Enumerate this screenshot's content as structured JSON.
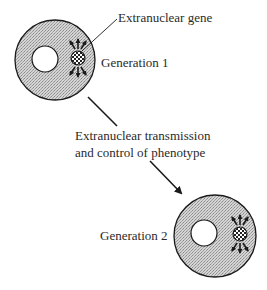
{
  "diagram": {
    "labels": {
      "gene": "Extranuclear gene",
      "generation1": "Generation 1",
      "transmission_line1": "Extranuclear transmission",
      "transmission_line2": "and control of phenotype",
      "generation2": "Generation 2"
    },
    "nodes": [
      {
        "id": "cell-generation-1",
        "cx": 55,
        "cy": 60,
        "r": 40,
        "nucleus": {
          "cx": 45,
          "cy": 59,
          "r": 13
        },
        "gene": {
          "cx": 78,
          "cy": 58,
          "r": 7
        }
      },
      {
        "id": "cell-generation-2",
        "cx": 215,
        "cy": 236,
        "r": 41,
        "nucleus": {
          "cx": 204,
          "cy": 233,
          "r": 13
        },
        "gene": {
          "cx": 240,
          "cy": 234,
          "r": 7
        }
      }
    ],
    "edges": [
      {
        "from": "cell-generation-1",
        "to": "cell-generation-2",
        "label": "Extranuclear transmission and control of phenotype"
      }
    ],
    "colors": {
      "cytoplasm_fill": "#c8c8c8",
      "stroke": "#1a1a1a",
      "nucleus_fill": "#ffffff",
      "text": "#2a2a2a"
    }
  }
}
